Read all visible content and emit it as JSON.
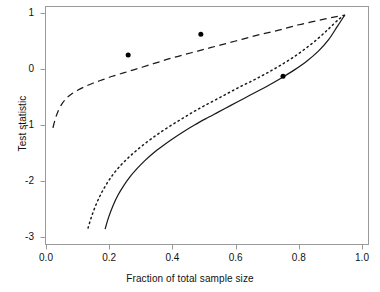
{
  "chart_data": {
    "type": "line",
    "title": "",
    "xlabel": "Fraction of total sample size",
    "ylabel": "Test statistic",
    "xlim": [
      0.0,
      1.0
    ],
    "ylim": [
      -3.0,
      1.0
    ],
    "grid": false,
    "legend": "none",
    "xticks": [
      "0.0",
      "0.2",
      "0.4",
      "0.6",
      "0.8",
      "1.0"
    ],
    "xtick_values": [
      0.0,
      0.2,
      0.4,
      0.6,
      0.8,
      1.0
    ],
    "yticks": [
      "1",
      "0",
      "-1",
      "-2",
      "-3"
    ],
    "ytick_values": [
      1,
      0,
      -1,
      -2,
      -3
    ],
    "series": [
      {
        "name": "upper-boundary",
        "style": "dashed",
        "color": "#1a1a1a",
        "points": [
          [
            0.022,
            -1.05
          ],
          [
            0.03,
            -0.88
          ],
          [
            0.04,
            -0.73
          ],
          [
            0.052,
            -0.61
          ],
          [
            0.065,
            -0.52
          ],
          [
            0.08,
            -0.45
          ],
          [
            0.1,
            -0.38
          ],
          [
            0.125,
            -0.31
          ],
          [
            0.15,
            -0.25
          ],
          [
            0.18,
            -0.19
          ],
          [
            0.21,
            -0.13
          ],
          [
            0.245,
            -0.07
          ],
          [
            0.28,
            -0.01
          ],
          [
            0.32,
            0.06
          ],
          [
            0.36,
            0.13
          ],
          [
            0.4,
            0.2
          ],
          [
            0.44,
            0.26
          ],
          [
            0.48,
            0.32
          ],
          [
            0.52,
            0.38
          ],
          [
            0.56,
            0.44
          ],
          [
            0.6,
            0.5
          ],
          [
            0.64,
            0.56
          ],
          [
            0.68,
            0.62
          ],
          [
            0.72,
            0.67
          ],
          [
            0.76,
            0.73
          ],
          [
            0.8,
            0.79
          ],
          [
            0.84,
            0.84
          ],
          [
            0.88,
            0.89
          ],
          [
            0.915,
            0.93
          ],
          [
            0.945,
            0.96
          ]
        ]
      },
      {
        "name": "middle-boundary",
        "style": "dotted",
        "color": "#1a1a1a",
        "points": [
          [
            0.133,
            -2.84
          ],
          [
            0.145,
            -2.62
          ],
          [
            0.16,
            -2.4
          ],
          [
            0.175,
            -2.22
          ],
          [
            0.192,
            -2.05
          ],
          [
            0.21,
            -1.9
          ],
          [
            0.23,
            -1.76
          ],
          [
            0.252,
            -1.63
          ],
          [
            0.275,
            -1.51
          ],
          [
            0.3,
            -1.39
          ],
          [
            0.33,
            -1.26
          ],
          [
            0.36,
            -1.14
          ],
          [
            0.395,
            -1.01
          ],
          [
            0.43,
            -0.89
          ],
          [
            0.465,
            -0.77
          ],
          [
            0.5,
            -0.66
          ],
          [
            0.54,
            -0.54
          ],
          [
            0.58,
            -0.42
          ],
          [
            0.62,
            -0.3
          ],
          [
            0.66,
            -0.19
          ],
          [
            0.7,
            -0.07
          ],
          [
            0.74,
            0.06
          ],
          [
            0.78,
            0.2
          ],
          [
            0.82,
            0.36
          ],
          [
            0.86,
            0.54
          ],
          [
            0.895,
            0.72
          ],
          [
            0.925,
            0.88
          ],
          [
            0.945,
            0.96
          ]
        ]
      },
      {
        "name": "lower-boundary",
        "style": "solid",
        "color": "#1a1a1a",
        "points": [
          [
            0.187,
            -2.86
          ],
          [
            0.198,
            -2.65
          ],
          [
            0.212,
            -2.44
          ],
          [
            0.228,
            -2.25
          ],
          [
            0.245,
            -2.09
          ],
          [
            0.265,
            -1.93
          ],
          [
            0.288,
            -1.78
          ],
          [
            0.312,
            -1.64
          ],
          [
            0.34,
            -1.5
          ],
          [
            0.37,
            -1.37
          ],
          [
            0.4,
            -1.25
          ],
          [
            0.435,
            -1.12
          ],
          [
            0.47,
            -1.0
          ],
          [
            0.505,
            -0.89
          ],
          [
            0.545,
            -0.77
          ],
          [
            0.585,
            -0.65
          ],
          [
            0.625,
            -0.53
          ],
          [
            0.665,
            -0.41
          ],
          [
            0.705,
            -0.29
          ],
          [
            0.745,
            -0.16
          ],
          [
            0.785,
            -0.02
          ],
          [
            0.825,
            0.14
          ],
          [
            0.862,
            0.32
          ],
          [
            0.895,
            0.53
          ],
          [
            0.922,
            0.76
          ],
          [
            0.945,
            0.96
          ]
        ]
      }
    ],
    "scatter": {
      "name": "observed-test-statistics",
      "marker": "filled-circle",
      "color": "#000000",
      "size_px": 5,
      "points": [
        {
          "x": 0.26,
          "y": 0.25
        },
        {
          "x": 0.49,
          "y": 0.62
        },
        {
          "x": 0.75,
          "y": -0.13
        }
      ]
    }
  },
  "figure": {
    "background": "#ffffff",
    "frame_color": "#999999",
    "axis_text_color": "#111111",
    "cropped_title_residue": ""
  }
}
